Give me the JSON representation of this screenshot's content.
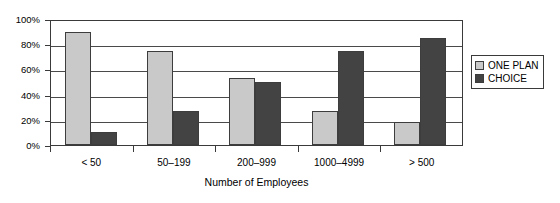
{
  "chart_data": {
    "type": "bar",
    "title": "",
    "xlabel": "Number of Employees",
    "ylabel": "",
    "categories": [
      "< 50",
      "50–199",
      "200–999",
      "1000–4999",
      "> 500"
    ],
    "series": [
      {
        "name": "ONE PLAN",
        "values": [
          90,
          75,
          53,
          27,
          18
        ],
        "color": "#c9c9c9"
      },
      {
        "name": "CHOICE",
        "values": [
          10,
          27,
          50,
          75,
          85
        ],
        "color": "#434343"
      }
    ],
    "ylim": [
      0,
      100
    ],
    "ytick_labels": [
      "100%",
      "80%",
      "60%",
      "40%",
      "20%",
      "0%"
    ],
    "ytick_values": [
      100,
      80,
      60,
      40,
      20,
      0
    ],
    "grid": true,
    "legend_position": "right",
    "axis_color": "#3a3a3a",
    "background": "#ffffff"
  },
  "legend": {
    "items": [
      {
        "label": "ONE PLAN",
        "swatch_color": "#c9c9c9"
      },
      {
        "label": "CHOICE",
        "swatch_color": "#434343"
      }
    ]
  }
}
